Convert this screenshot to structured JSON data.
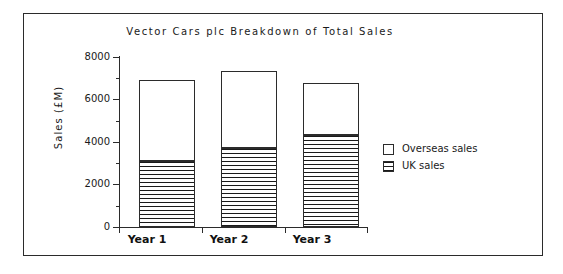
{
  "chart_data": {
    "type": "bar",
    "subtype": "stacked",
    "title": "Vector Cars plc Breakdown of Total Sales",
    "xlabel": "",
    "ylabel": "Sales  (£M)",
    "categories": [
      "Year 1",
      "Year 2",
      "Year 3"
    ],
    "series": [
      {
        "name": "UK sales",
        "values": [
          3100,
          3700,
          4350
        ]
      },
      {
        "name": "Overseas sales",
        "values": [
          3800,
          3650,
          2450
        ]
      }
    ],
    "totals": [
      6900,
      7350,
      6800
    ],
    "ylim": [
      0,
      8000
    ],
    "ytick_labels": [
      "0",
      "2000",
      "4000",
      "6000",
      "8000"
    ],
    "ytick_values": [
      0,
      2000,
      4000,
      6000,
      8000
    ],
    "yminor_values": [
      1000,
      3000,
      5000,
      7000
    ],
    "grid": false,
    "legend_position": "right",
    "legend_entries": [
      {
        "label": "Overseas sales",
        "fill": "white"
      },
      {
        "label": "UK sales",
        "fill": "horizontal-hatch"
      }
    ],
    "colors": {
      "axis": "#2b2b2b",
      "text": "#1a1a1a",
      "hatch": "#1a1a1a",
      "background": "#ffffff"
    }
  },
  "figure": {
    "title": "Vector Cars plc Breakdown of Total Sales",
    "y_axis_title": "Sales  (£M)",
    "y_ticks": [
      {
        "label": "8000"
      },
      {
        "label": "6000"
      },
      {
        "label": "4000"
      },
      {
        "label": "2000"
      },
      {
        "label": "0"
      }
    ],
    "bars": [
      {
        "category": "Year 1",
        "uk": 3100,
        "overseas": 3800,
        "total": 6900
      },
      {
        "category": "Year 2",
        "uk": 3700,
        "overseas": 3650,
        "total": 7350
      },
      {
        "category": "Year 3",
        "uk": 4350,
        "overseas": 2450,
        "total": 6800
      }
    ],
    "legend": [
      {
        "label": "Overseas sales"
      },
      {
        "label": "UK sales"
      }
    ]
  }
}
